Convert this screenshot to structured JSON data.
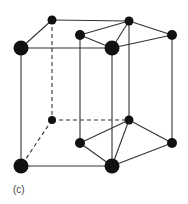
{
  "figure": {
    "label": "(c)",
    "colors": {
      "line": "#333333",
      "atom": "#111111"
    },
    "atoms": [
      {
        "id": "t-bl",
        "x": 52,
        "y": 20,
        "r": 4.5
      },
      {
        "id": "t-br",
        "x": 129,
        "y": 21,
        "r": 4.5
      },
      {
        "id": "t-mid",
        "x": 80,
        "y": 35,
        "r": 5
      },
      {
        "id": "t-r",
        "x": 172,
        "y": 35,
        "r": 5
      },
      {
        "id": "t-fl",
        "x": 21,
        "y": 48,
        "r": 7.5
      },
      {
        "id": "t-c",
        "x": 112,
        "y": 48,
        "r": 7.5
      },
      {
        "id": "b-bl",
        "x": 52,
        "y": 120,
        "r": 4
      },
      {
        "id": "b-br",
        "x": 129,
        "y": 120,
        "r": 4.5
      },
      {
        "id": "b-mid",
        "x": 80,
        "y": 143,
        "r": 5
      },
      {
        "id": "b-r",
        "x": 172,
        "y": 143,
        "r": 5
      },
      {
        "id": "b-fl",
        "x": 21,
        "y": 166,
        "r": 7.5
      },
      {
        "id": "b-c",
        "x": 112,
        "y": 166,
        "r": 7.5
      }
    ]
  }
}
